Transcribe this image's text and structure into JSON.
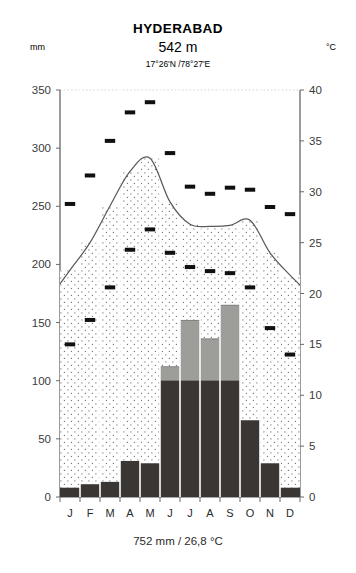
{
  "header": {
    "title": "HYDERABAD",
    "elevation": "542 m",
    "coordinates": "17°26'N /78°27'E",
    "left_unit": "mm",
    "right_unit": "°C"
  },
  "footer": {
    "summary": "752 mm / 26,8 °C"
  },
  "chart_data": {
    "type": "bar",
    "title": "HYDERABAD",
    "subtitle": "542 m",
    "annotation": "17°26'N /78°27'E",
    "categories": [
      "J",
      "F",
      "M",
      "A",
      "M",
      "J",
      "J",
      "A",
      "S",
      "O",
      "N",
      "D"
    ],
    "month_labels": [
      "J",
      "F",
      "M",
      "A",
      "M",
      "J",
      "J",
      "A",
      "S",
      "O",
      "N",
      "D"
    ],
    "xlabel": "",
    "ylabel": "mm",
    "y2label": "°C",
    "ylim": [
      0,
      350
    ],
    "y2lim": [
      0,
      40
    ],
    "yticks": [
      0,
      50,
      100,
      150,
      200,
      250,
      300,
      350
    ],
    "ytick_labels": [
      "0",
      "50",
      "100",
      "150",
      "200",
      "250",
      "300",
      "350"
    ],
    "y2ticks": [
      0,
      5,
      10,
      15,
      20,
      25,
      30,
      35,
      40
    ],
    "y2tick_labels": [
      "0",
      "5",
      "10",
      "15",
      "20",
      "25",
      "30",
      "35",
      "40"
    ],
    "grid": false,
    "legend": "none",
    "series": [
      {
        "name": "Precipitation (mm)",
        "key": "precipitation_mm",
        "values": [
          8,
          11,
          13,
          31,
          29,
          112,
          152,
          136,
          165,
          66,
          29,
          8
        ],
        "style": "bar"
      },
      {
        "name": "Mean temperature (°C)",
        "key": "temperature_mean_c",
        "values": [
          22.3,
          25.0,
          28.6,
          32.0,
          33.3,
          29.0,
          26.8,
          26.6,
          26.7,
          27.2,
          24.0,
          21.8
        ],
        "style": "line"
      },
      {
        "name": "Mean daily maximum (°C)",
        "key": "temperature_max_c",
        "values": [
          28.8,
          31.6,
          35.0,
          37.8,
          38.8,
          33.8,
          30.5,
          29.8,
          30.4,
          30.2,
          28.5,
          27.8
        ],
        "style": "dash-marker"
      },
      {
        "name": "Mean daily minimum (°C)",
        "key": "temperature_min_c",
        "values": [
          15.0,
          17.4,
          20.6,
          24.3,
          26.3,
          24.0,
          22.6,
          22.2,
          22.0,
          20.6,
          16.6,
          14.0
        ]
      }
    ],
    "annual_precipitation_mm": 752,
    "annual_mean_temperature_c": 26.8,
    "bar_split": {
      "description": "Portion of each precipitation bar drawn in dark (up to 100 mm) versus light grey (above 100 mm, compressed scale)",
      "dark_cap_mm": 100
    },
    "colors": {
      "bar_dry": "#3a3633",
      "bar_wet": "#9d9d9a",
      "curve": "#5a5a5a",
      "marker": "#101010",
      "axis": "#4a4a4a",
      "background": "#ffffff"
    }
  }
}
